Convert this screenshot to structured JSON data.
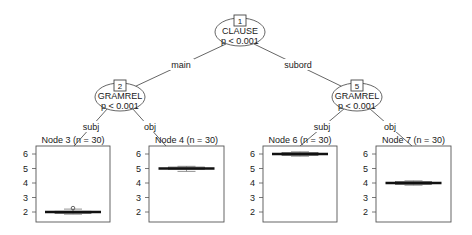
{
  "colors": {
    "line": "#555555",
    "box": "#1a1a1a",
    "frame": "#555555",
    "median": "#111111"
  },
  "inner_nodes": [
    {
      "id": "1",
      "variable": "CLAUSE",
      "p": "p < 0.001",
      "cx": 240,
      "cy": 32
    },
    {
      "id": "2",
      "variable": "GRAMREL",
      "p": "p < 0.001",
      "cx": 120,
      "cy": 97
    },
    {
      "id": "5",
      "variable": "GRAMREL",
      "p": "p < 0.001",
      "cx": 357,
      "cy": 97
    }
  ],
  "edges": [
    {
      "from": "1",
      "to": "2",
      "label": "main"
    },
    {
      "from": "1",
      "to": "5",
      "label": "subord"
    },
    {
      "from": "2",
      "to": "3",
      "label": "subj"
    },
    {
      "from": "2",
      "to": "4",
      "label": "obj"
    },
    {
      "from": "5",
      "to": "6",
      "label": "subj"
    },
    {
      "from": "5",
      "to": "7",
      "label": "obj"
    }
  ],
  "terminal_nodes": [
    {
      "id": "3",
      "title": "Node 3 (n = 30)",
      "median": 2.0,
      "q1": 1.9,
      "q3": 2.05,
      "min": 1.85,
      "max": 2.2,
      "outlier": 2.2
    },
    {
      "id": "4",
      "title": "Node 4 (n = 30)",
      "median": 5.0,
      "q1": 4.95,
      "q3": 5.1,
      "min": 4.8,
      "max": 5.15
    },
    {
      "id": "6",
      "title": "Node 6 (n = 30)",
      "median": 6.0,
      "q1": 5.9,
      "q3": 6.1,
      "min": 5.85,
      "max": 6.15
    },
    {
      "id": "7",
      "title": "Node 7 (n = 30)",
      "median": 4.0,
      "q1": 3.9,
      "q3": 4.1,
      "min": 3.85,
      "max": 4.15
    }
  ],
  "y_axis": {
    "ticks": [
      "2",
      "3",
      "4",
      "5",
      "6"
    ],
    "min": 1.7,
    "max": 6.35
  }
}
